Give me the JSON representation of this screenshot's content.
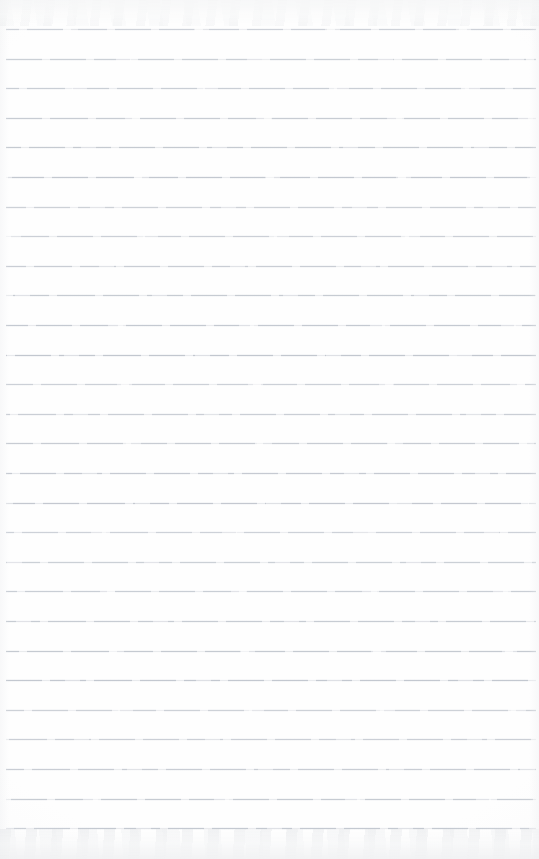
{
  "document": {
    "kind": "scanned-ruled-notepad-page",
    "title": "Blank Ruled Notepad Page",
    "content_text": "",
    "page_width_px": 539,
    "page_height_px": 859,
    "paper_color": "#fefefe",
    "background_color": "#ffffff",
    "has_handwriting": false,
    "has_printed_text": false,
    "has_margin_rule": false,
    "has_holes": false,
    "orientation": "portrait"
  },
  "ruling": {
    "style": "horizontal-ruled",
    "line_color": "#c2c7cf",
    "line_thickness_px": 1,
    "line_count": 28,
    "line_spacing_px": 29.6,
    "first_line_y_px": 29,
    "last_line_y_px": 829,
    "line_start_x_px": 6,
    "line_end_x_px": 536,
    "line_y_positions": [
      29,
      58.6,
      88.2,
      117.8,
      147.4,
      177,
      206.6,
      236.2,
      265.8,
      295.4,
      325,
      354.6,
      384.2,
      413.8,
      443.4,
      473,
      502.6,
      532.2,
      561.8,
      591.4,
      621,
      650.6,
      680.2,
      709.8,
      739.4,
      769,
      798.6,
      828.2
    ]
  },
  "scan_artifacts": {
    "top_edge_noise_color": "#eceef0",
    "bottom_edge_noise_color": "#e9ebed",
    "side_edge_shadow_color": "#f0f1f3",
    "top_edge_height_px": 26,
    "bottom_edge_height_px": 30
  }
}
